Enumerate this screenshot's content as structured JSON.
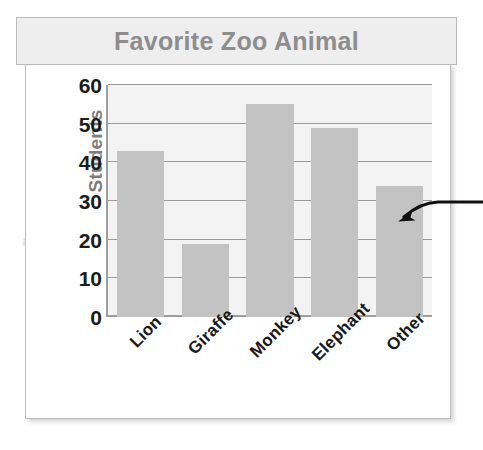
{
  "chart_data": {
    "type": "bar",
    "title": "Favorite Zoo Animal",
    "xlabel": "",
    "ylabel": "Students",
    "categories": [
      "Lion",
      "Giraffe",
      "Monkey",
      "Elephant",
      "Other"
    ],
    "values": [
      43,
      19,
      55,
      49,
      34
    ],
    "ylim": [
      0,
      60
    ],
    "ytick_labels": [
      "60",
      "50",
      "40",
      "30",
      "20",
      "10",
      "0"
    ],
    "ytick_values": [
      60,
      50,
      40,
      30,
      20,
      10,
      0
    ],
    "grid": true,
    "legend": false,
    "bar_color": "#c3c3c3",
    "plot_background": "#f3f3f3",
    "gridline_color": "#9a9a9a",
    "title_color": "#8d8d8d",
    "title_banner_color": "#eeeeee",
    "axis_label_color": "#7d7d7d",
    "tick_label_color": "#1a1a1a",
    "annotations": [
      {
        "name": "pointer-arrow",
        "target_category": "Other",
        "color": "#111111",
        "description": "curved black arrow entering from the right edge and pointing at the Other bar"
      }
    ]
  },
  "background_ghost_text": {
    "line1": "Chart 1.2 Grade 4",
    "line2": "sample question 1.2.1",
    "line3": "a)",
    "line4": "b)"
  }
}
